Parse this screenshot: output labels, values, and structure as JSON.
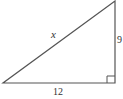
{
  "diagram": {
    "type": "right-triangle",
    "labels": {
      "hypotenuse": "x",
      "vertical_leg": "9",
      "horizontal_leg": "12"
    },
    "right_angle_marker": "bottom-right",
    "colors": {
      "stroke": "#555555",
      "text": "#333333",
      "background": "#ffffff"
    }
  }
}
